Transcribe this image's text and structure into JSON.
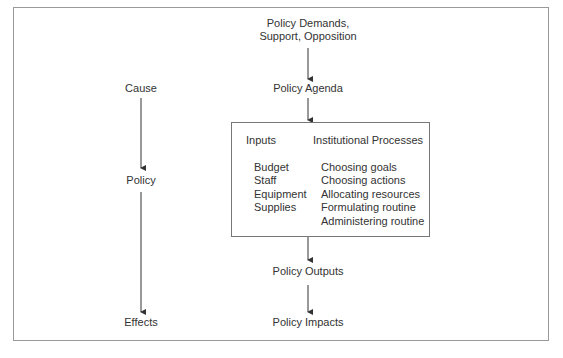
{
  "diagram": {
    "left_column": {
      "cause": "Cause",
      "policy": "Policy",
      "effects": "Effects"
    },
    "center_column": {
      "demands_line1": "Policy Demands,",
      "demands_line2": "Support, Opposition",
      "agenda": "Policy Agenda",
      "outputs": "Policy Outputs",
      "impacts": "Policy Impacts"
    },
    "process_box": {
      "inputs_header": "Inputs",
      "processes_header": "Institutional Processes",
      "inputs": [
        "Budget",
        "Staff",
        "Equipment",
        "Supplies"
      ],
      "processes": [
        "Choosing goals",
        "Choosing actions",
        "Allocating resources",
        "Formulating routine",
        "Administering routine"
      ]
    }
  }
}
